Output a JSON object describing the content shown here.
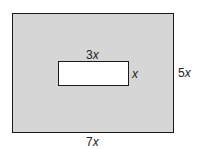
{
  "diagram": {
    "outer_rectangle": {
      "width_label": "7x",
      "height_label": "5x",
      "fill": "#d6d6d6"
    },
    "inner_rectangle": {
      "width_label": "3x",
      "height_label": "x",
      "fill": "#ffffff"
    },
    "labels": {
      "inner_width": "3x",
      "inner_height": "x",
      "outer_height": "5x",
      "outer_width": "7x"
    }
  }
}
